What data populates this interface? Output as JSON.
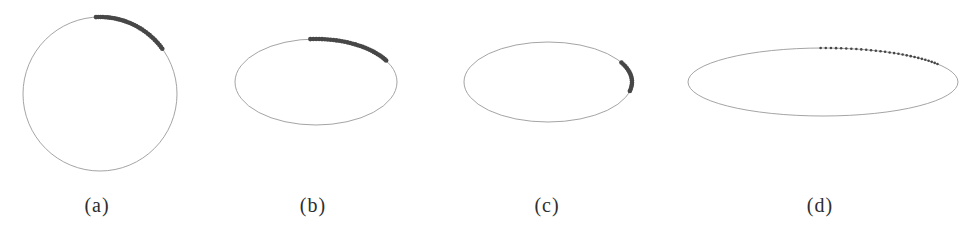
{
  "figure": {
    "background": "#ffffff",
    "outline_color": "#9a9a9a",
    "outline_width": 0.9,
    "dot_color": "#474747",
    "label_y": 194,
    "panels": [
      {
        "id": "a",
        "label": "(a)",
        "shape": "circle",
        "cx": 100,
        "cy": 94,
        "rx": 77,
        "ry": 77,
        "label_x": 97,
        "arc": {
          "start_deg": 36,
          "end_deg": 93,
          "dot_radius": 2.3,
          "dot_count": 34,
          "appearance": "overlapping-thick-band"
        }
      },
      {
        "id": "b",
        "label": "(b)",
        "shape": "ellipse",
        "cx": 316,
        "cy": 82,
        "rx": 81,
        "ry": 43,
        "label_x": 313,
        "arc": {
          "start_deg": 30,
          "end_deg": 94,
          "dot_radius": 2.3,
          "dot_count": 32,
          "appearance": "overlapping-thick-band"
        }
      },
      {
        "id": "c",
        "label": "(c)",
        "shape": "ellipse",
        "cx": 548,
        "cy": 82,
        "rx": 84,
        "ry": 40,
        "label_x": 547,
        "arc": {
          "start_deg": -13,
          "end_deg": 29,
          "dot_radius": 2.3,
          "dot_count": 15,
          "appearance": "overlapping-thick-band"
        }
      },
      {
        "id": "d",
        "label": "(d)",
        "shape": "ellipse",
        "cx": 823,
        "cy": 82,
        "rx": 135,
        "ry": 34,
        "label_x": 820,
        "arc": {
          "start_deg": 32,
          "end_deg": 91,
          "dot_radius": 1.3,
          "dot_count": 28,
          "appearance": "discrete-dots"
        }
      }
    ]
  }
}
